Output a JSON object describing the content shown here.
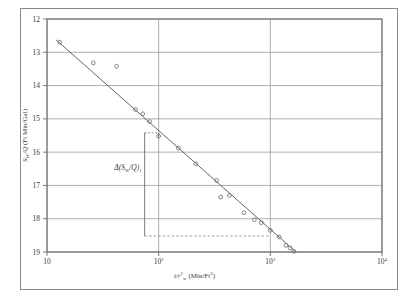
{
  "chart_data": {
    "type": "scatter",
    "title": "",
    "subtitle": "",
    "xlabel": "t/r²w (Min/Ft²)",
    "xlabel_parts": {
      "lead": "t/r",
      "sup": "2",
      "sub": "w",
      "units": " (Min/Ft",
      "units_sup": "2",
      "units_close": ")"
    },
    "ylabel": "Sw/Q  (Ft Min/Gal)",
    "ylabel_parts": {
      "lead": "S",
      "sub": "W",
      "mid": "/Q",
      "units": "  (Ft Min/Gal)"
    },
    "xscale": "log",
    "yscale": "linear",
    "xlim": [
      10,
      10000
    ],
    "ylim": [
      19,
      12
    ],
    "y_inverted": true,
    "grid": true,
    "grid_x": true,
    "grid_y": true,
    "legend": "none",
    "xticks": [
      10,
      100,
      1000,
      10000
    ],
    "xtick_labels": [
      "10",
      "10²",
      "10³",
      "10⁴"
    ],
    "xtick_bases": [
      "10",
      "10",
      "10",
      "10"
    ],
    "xtick_exps": [
      "",
      "2",
      "3",
      "4"
    ],
    "yticks": [
      12,
      13,
      14,
      15,
      16,
      17,
      18,
      19
    ],
    "ytick_labels": [
      "12",
      "13",
      "14",
      "15",
      "16",
      "17",
      "18",
      "19"
    ],
    "marker": "open-circle",
    "marker_color": "#6b6b6b",
    "line_color": "#555555",
    "points": [
      {
        "x": 13.0,
        "y": 12.7
      },
      {
        "x": 26.0,
        "y": 13.32
      },
      {
        "x": 42.0,
        "y": 13.42
      },
      {
        "x": 62.0,
        "y": 14.72
      },
      {
        "x": 72.0,
        "y": 14.85
      },
      {
        "x": 83.0,
        "y": 15.08
      },
      {
        "x": 100.0,
        "y": 15.52
      },
      {
        "x": 150.0,
        "y": 15.88
      },
      {
        "x": 215.0,
        "y": 16.35
      },
      {
        "x": 330.0,
        "y": 16.85
      },
      {
        "x": 360.0,
        "y": 17.35
      },
      {
        "x": 430.0,
        "y": 17.3
      },
      {
        "x": 580.0,
        "y": 17.82
      },
      {
        "x": 720.0,
        "y": 18.03
      },
      {
        "x": 830.0,
        "y": 18.12
      },
      {
        "x": 1000.0,
        "y": 18.35
      },
      {
        "x": 1200.0,
        "y": 18.55
      },
      {
        "x": 1380.0,
        "y": 18.8
      },
      {
        "x": 1500.0,
        "y": 18.88
      },
      {
        "x": 1620.0,
        "y": 18.98
      }
    ],
    "fit_line": {
      "x0": 12.0,
      "y0": 12.62,
      "x1": 1700.0,
      "y1": 19.0
    },
    "annotations": [
      {
        "text": "Δ(SW/Q)1",
        "text_parts": {
          "delta": "Δ(",
          "s": "S",
          "sub": "W",
          "mid": "/Q)",
          "idx": "1"
        },
        "x_data": 100,
        "y_top": 15.42,
        "y_bottom": 18.52,
        "x_right_data": 1000,
        "style": "bracket-with-dashed-baseline"
      }
    ]
  }
}
